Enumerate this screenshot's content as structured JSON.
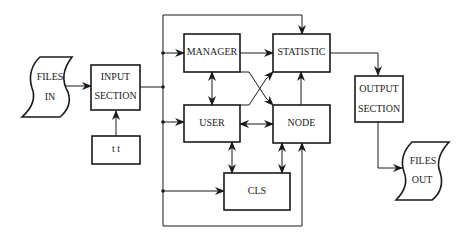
{
  "diagram": {
    "nodes": {
      "files_in": {
        "line1": "FILES",
        "line2": "IN",
        "shape": "document"
      },
      "input_section": {
        "line1": "INPUT",
        "line2": "SECTION",
        "shape": "box"
      },
      "tt": {
        "label": "t t",
        "shape": "box"
      },
      "manager": {
        "label": "MANAGER",
        "shape": "box"
      },
      "statistic": {
        "label": "STATISTIC",
        "shape": "box"
      },
      "user": {
        "label": "USER",
        "shape": "box"
      },
      "node": {
        "label": "NODE",
        "shape": "box"
      },
      "cls": {
        "label": "CLS",
        "shape": "box"
      },
      "output_section": {
        "line1": "OUTPUT",
        "line2": "SECTION",
        "shape": "box"
      },
      "files_out": {
        "line1": "FILES",
        "line2": "OUT",
        "shape": "document"
      }
    },
    "edges": [
      {
        "from": "FILES IN",
        "to": "INPUT SECTION",
        "type": "arrow"
      },
      {
        "from": "t t",
        "to": "INPUT SECTION",
        "type": "arrow"
      },
      {
        "from": "INPUT SECTION",
        "to": "bus",
        "type": "line"
      },
      {
        "from": "bus",
        "to": "STATISTIC",
        "type": "arrow",
        "route": "top"
      },
      {
        "from": "bus",
        "to": "MANAGER",
        "type": "arrow"
      },
      {
        "from": "bus",
        "to": "USER",
        "type": "arrow"
      },
      {
        "from": "bus",
        "to": "CLS",
        "type": "arrow"
      },
      {
        "from": "bus",
        "to": "NODE",
        "type": "arrow",
        "route": "bottom"
      },
      {
        "from": "MANAGER",
        "to": "STATISTIC",
        "type": "arrow"
      },
      {
        "from": "MANAGER",
        "to": "USER",
        "type": "bidirectional"
      },
      {
        "from": "MANAGER",
        "to": "NODE",
        "type": "arrow",
        "route": "diagonal"
      },
      {
        "from": "USER",
        "to": "STATISTIC",
        "type": "arrow",
        "route": "diagonal"
      },
      {
        "from": "USER",
        "to": "NODE",
        "type": "bidirectional"
      },
      {
        "from": "NODE",
        "to": "STATISTIC",
        "type": "arrow"
      },
      {
        "from": "USER",
        "to": "CLS",
        "type": "bidirectional"
      },
      {
        "from": "NODE",
        "to": "CLS",
        "type": "bidirectional"
      },
      {
        "from": "STATISTIC",
        "to": "OUTPUT SECTION",
        "type": "arrow"
      },
      {
        "from": "OUTPUT SECTION",
        "to": "FILES OUT",
        "type": "arrow"
      }
    ]
  }
}
